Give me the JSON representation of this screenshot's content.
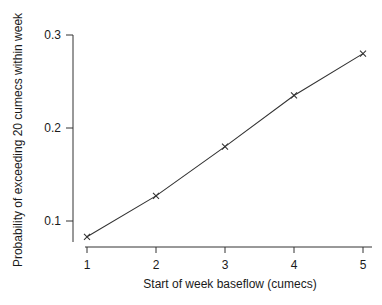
{
  "chart_data": {
    "type": "line",
    "title": "",
    "xlabel": "Start of week baseflow (cumecs)",
    "ylabel": "Probability of exceeding 20 cumecs within week",
    "x": [
      1,
      2,
      3,
      4,
      5
    ],
    "series": [
      {
        "name": "Probability",
        "values": [
          0.083,
          0.127,
          0.18,
          0.235,
          0.28
        ],
        "marker": "x",
        "color": "#333333"
      }
    ],
    "xticks": [
      1,
      2,
      3,
      4,
      5
    ],
    "xtick_labels": [
      "1",
      "2",
      "3",
      "4",
      "5"
    ],
    "yticks": [
      0.1,
      0.2,
      0.3
    ],
    "ytick_labels": [
      "0.1",
      "0.2",
      "0.3"
    ],
    "xlim": [
      0.8,
      5.1
    ],
    "ylim": [
      0.077,
      0.3
    ],
    "grid": false,
    "legend": null
  },
  "layout": {
    "x_px": {
      "v0": 1,
      "p0": 87,
      "v1": 5,
      "p1": 363
    },
    "y_px": {
      "v0": 0.1,
      "p0": 221,
      "v1": 0.3,
      "p1": 35
    },
    "x_axis_y": 247,
    "x_axis_from": 85,
    "x_axis_to": 372,
    "y_axis_x": 73,
    "y_axis_from": 35,
    "y_axis_to": 242
  }
}
